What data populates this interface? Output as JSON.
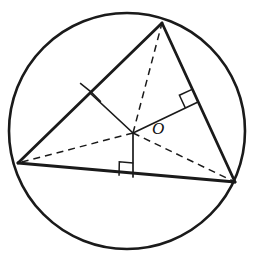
{
  "figure": {
    "type": "geometry-diagram",
    "canvas": {
      "width": 254,
      "height": 255
    },
    "background_color": "#ffffff",
    "stroke_color": "#1a1a1a"
  },
  "labels": {
    "center_point": "O"
  },
  "circle": {
    "name": "circumcircle",
    "cx": 127,
    "cy": 131,
    "r": 118,
    "stroke_width": 2.6,
    "fill": "none"
  },
  "points": {
    "A": {
      "x": 18,
      "y": 163,
      "name": "vertex-left"
    },
    "B": {
      "x": 162,
      "y": 23,
      "name": "vertex-top"
    },
    "C": {
      "x": 235,
      "y": 182,
      "name": "vertex-right"
    },
    "O": {
      "x": 133,
      "y": 133,
      "name": "circumcenter"
    },
    "M_AB": {
      "x": 90,
      "y": 93,
      "name": "midpoint-left-side"
    },
    "M_BC": {
      "x": 198,
      "y": 102,
      "name": "midpoint-right-side"
    },
    "M_AC": {
      "x": 133,
      "y": 177,
      "name": "midpoint-bottom-side"
    }
  },
  "triangle_sides": [
    {
      "name": "side-AB",
      "from": "A",
      "to": "B",
      "style": "solid",
      "stroke_width": 2.8
    },
    {
      "name": "side-BC",
      "from": "B",
      "to": "C",
      "style": "solid",
      "stroke_width": 2.8
    },
    {
      "name": "side-AC",
      "from": "A",
      "to": "C",
      "style": "solid",
      "stroke_width": 3.0
    }
  ],
  "perpendicular_bisectors": [
    {
      "name": "bisector-to-AB",
      "from": "O",
      "to": "M_AB",
      "style": "solid",
      "stroke_width": 1.7
    },
    {
      "name": "bisector-to-BC",
      "from": "O",
      "to": "M_BC",
      "style": "solid",
      "stroke_width": 1.7
    },
    {
      "name": "bisector-to-AC",
      "from": "O",
      "to": "M_AC",
      "style": "solid",
      "stroke_width": 1.7
    }
  ],
  "radii": [
    {
      "name": "radius-OA",
      "from": "O",
      "to": "A",
      "style": "dashed",
      "stroke_width": 1.5
    },
    {
      "name": "radius-OB",
      "from": "O",
      "to": "B",
      "style": "dashed",
      "stroke_width": 1.5
    },
    {
      "name": "radius-OC",
      "from": "O",
      "to": "C",
      "style": "dashed",
      "stroke_width": 1.5
    }
  ],
  "right_angle_marks": [
    {
      "name": "right-angle-at-AB-midpoint",
      "vertex_x": 90,
      "vertex_y": 93,
      "size": 14,
      "along_deg": 225,
      "toward_deg": 39
    },
    {
      "name": "right-angle-at-BC-midpoint",
      "vertex_x": 198,
      "vertex_y": 102,
      "size": 14,
      "along_deg": 155,
      "toward_deg": 245
    },
    {
      "name": "right-angle-at-AC-midpoint",
      "vertex_x": 133,
      "vertex_y": 177,
      "size": 14,
      "along_deg": 185,
      "toward_deg": 271
    }
  ],
  "dash_pattern": "7 5"
}
